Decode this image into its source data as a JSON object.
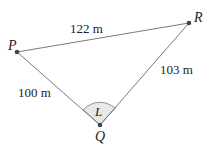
{
  "points": {
    "P": {
      "label": "P",
      "x": 17,
      "y": 52
    },
    "R": {
      "label": "R",
      "x": 189,
      "y": 23
    },
    "Q": {
      "label": "Q",
      "x": 100,
      "y": 125
    }
  },
  "sides": {
    "PR": "122 m",
    "PQ": "100 m",
    "QR": "103 m"
  },
  "angle": {
    "label": "L",
    "vertex": "Q"
  },
  "colors": {
    "line": "#7a7a7a",
    "point": "#444444",
    "arc_fill": "#e8e8e8"
  }
}
